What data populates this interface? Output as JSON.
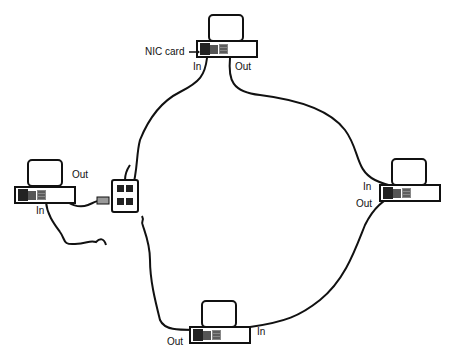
{
  "diagram": {
    "title": "",
    "computers": [
      {
        "id": "top",
        "labels": {
          "in": "In",
          "out": "Out",
          "nic": "NIC card"
        }
      },
      {
        "id": "left",
        "labels": {
          "in": "In",
          "out": "Out"
        }
      },
      {
        "id": "right",
        "labels": {
          "in": "In",
          "out": "Out"
        }
      },
      {
        "id": "bottom",
        "labels": {
          "in": "In",
          "out": "Out"
        }
      }
    ],
    "devices": [
      {
        "id": "wall-jack",
        "name": "four-port jack"
      }
    ]
  }
}
